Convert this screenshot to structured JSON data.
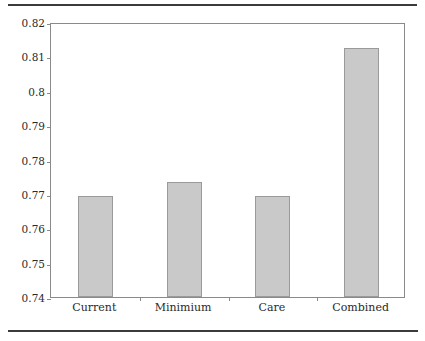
{
  "figure": {
    "has_top_rule": true,
    "has_bottom_rule": true,
    "rule_color": "#3b3b3b",
    "background": "#ffffff"
  },
  "axis": {
    "y_tick_labels": [
      "0.82",
      "0.81",
      "0.8",
      "0.79",
      "0.78",
      "0.77",
      "0.76",
      "0.75",
      "0.74"
    ],
    "x_tick_labels": [
      "Current",
      "Minimium",
      "Care",
      "Combined"
    ]
  },
  "style": {
    "bar_fill": "#c9c9c9",
    "bar_border": "#9a9a9a",
    "frame_color": "#8a8a8a",
    "text_color": "#2a2a2a"
  },
  "chart_data": {
    "type": "bar",
    "title": "",
    "subtitle": "",
    "xlabel": "",
    "ylabel": "",
    "categories": [
      "Current",
      "Minimium",
      "Care",
      "Combined"
    ],
    "values": [
      0.7695,
      0.7735,
      0.7695,
      0.8125
    ],
    "ylim": [
      0.74,
      0.82
    ],
    "ytick_values": [
      0.74,
      0.75,
      0.76,
      0.77,
      0.78,
      0.79,
      0.8,
      0.81,
      0.82
    ],
    "ytick_labels": [
      "0.74",
      "0.75",
      "0.76",
      "0.77",
      "0.78",
      "0.79",
      "0.8",
      "0.81",
      "0.82"
    ],
    "grid": false,
    "legend": false,
    "legend_position": "none",
    "bar_color": "#c9c9c9",
    "annotations": []
  }
}
